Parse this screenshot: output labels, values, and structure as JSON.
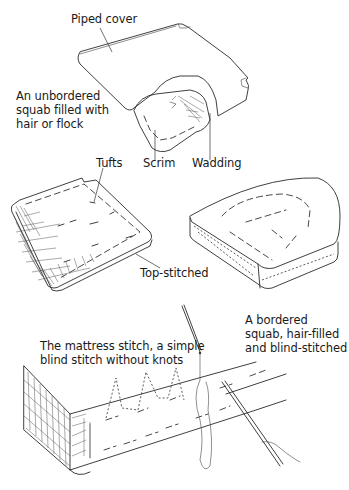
{
  "figure": {
    "type": "upholstery illustration",
    "panels": [
      {
        "id": "unbordered-squab",
        "description": "An unbordered squab filled with hair or flock",
        "labels": {
          "piped_cover": "Piped cover",
          "description": "An unbordered\nsquab filled with\nhair or flock",
          "tufts": "Tufts",
          "scrim": "Scrim",
          "wadding": "Wadding",
          "top_stitched": "Top-stitched"
        }
      },
      {
        "id": "bordered-squab",
        "labels": {
          "description": "A bordered\nsquab, hair-filled\nand blind-stitched"
        }
      },
      {
        "id": "mattress-stitch",
        "labels": {
          "description": "The mattress stitch, a simple\nblind stitch without knots"
        }
      }
    ],
    "caption_partial": ""
  },
  "colors": {
    "ink": "#2a2a2a",
    "background": "#ffffff"
  }
}
